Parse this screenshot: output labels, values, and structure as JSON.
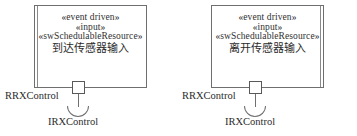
{
  "diagram": {
    "type": "uml-component-diagram",
    "background_color": "#ffffff",
    "line_color": "#6f6f6f",
    "text_color": "#2b2b2b"
  },
  "components": [
    {
      "id": "arrival-sensor-input",
      "stereotypes": [
        "«event driven»",
        "«input»",
        "«swSchedulableResource»"
      ],
      "name": "到达传感器输入",
      "provided_interface_label": "RRXControl",
      "required_interface_label": "IRXControl"
    },
    {
      "id": "departure-sensor-input",
      "stereotypes": [
        "«event driven»",
        "«input»",
        "«swSchedulableResource»"
      ],
      "name": "离开传感器输入",
      "provided_interface_label": "RRXControl",
      "required_interface_label": "IRXControl"
    }
  ]
}
